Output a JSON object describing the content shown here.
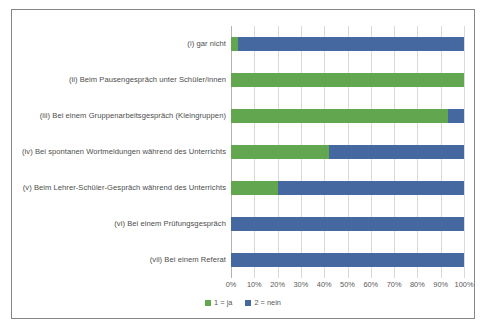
{
  "chart_data": {
    "type": "bar",
    "orientation": "horizontal",
    "stacked": true,
    "normalized": true,
    "title": "",
    "xlabel": "",
    "ylabel": "",
    "xlim": [
      0,
      100
    ],
    "grid": true,
    "legend_position": "bottom",
    "xtick_labels": [
      "0%",
      "10%",
      "20%",
      "30%",
      "40%",
      "50%",
      "60%",
      "70%",
      "80%",
      "90%",
      "100%"
    ],
    "xtick_values": [
      0,
      10,
      20,
      30,
      40,
      50,
      60,
      70,
      80,
      90,
      100
    ],
    "categories": [
      "(i) gar nicht",
      "(ii) Beim Pausengespräch unter Schüler/innen",
      "(iii) Bei einem Gruppenarbeitsgespräch (Kleingruppen)",
      "(iv) Bei spontanen Wortmeldungen während des Unterrichts",
      "(v) Beim Lehrer-Schüler-Gespräch während des Unterrichts",
      "(vi) Bei einem Prüfungsgespräch",
      "(vii) Bei einem Referat"
    ],
    "series": [
      {
        "name": "1 = ja",
        "color": "#62A74F",
        "values": [
          3,
          100,
          93,
          42,
          20,
          0,
          0
        ]
      },
      {
        "name": "2 = nein",
        "color": "#44689F",
        "values": [
          97,
          0,
          7,
          58,
          80,
          100,
          100
        ]
      }
    ],
    "legend": [
      {
        "label": "1 = ja",
        "color": "#62A74F"
      },
      {
        "label": "2 = nein",
        "color": "#44689F"
      }
    ]
  }
}
